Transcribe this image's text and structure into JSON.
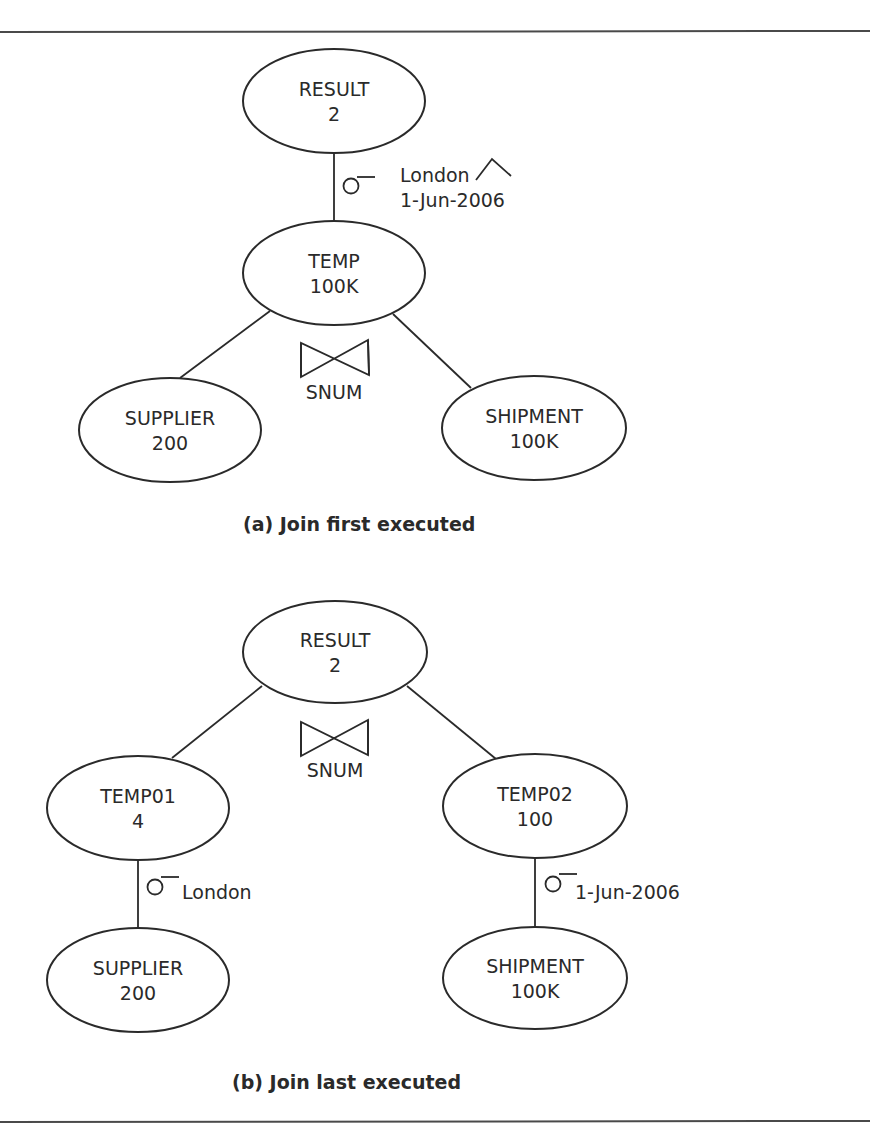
{
  "colors": {
    "line": "#2a2a2a",
    "background": "#ffffff"
  },
  "diagram_a": {
    "caption": "(a) Join first executed",
    "nodes": {
      "result": {
        "name": "RESULT",
        "count": "2"
      },
      "temp": {
        "name": "TEMP",
        "count": "100K"
      },
      "supplier": {
        "name": "SUPPLIER",
        "count": "200"
      },
      "shipment": {
        "name": "SHIPMENT",
        "count": "100K"
      }
    },
    "selection": {
      "symbol": "σ",
      "condition_line1": "London",
      "and_symbol": "∧",
      "condition_line2": "1-Jun-2006"
    },
    "join": {
      "symbol": "⋈",
      "attribute": "SNUM"
    }
  },
  "diagram_b": {
    "caption": "(b) Join last executed",
    "nodes": {
      "result": {
        "name": "RESULT",
        "count": "2"
      },
      "temp01": {
        "name": "TEMP01",
        "count": "4"
      },
      "temp02": {
        "name": "TEMP02",
        "count": "100"
      },
      "supplier": {
        "name": "SUPPLIER",
        "count": "200"
      },
      "shipment": {
        "name": "SHIPMENT",
        "count": "100K"
      }
    },
    "join": {
      "symbol": "⋈",
      "attribute": "SNUM"
    },
    "selection_left": {
      "symbol": "σ",
      "condition": "London"
    },
    "selection_right": {
      "symbol": "σ",
      "condition": "1-Jun-2006"
    }
  }
}
